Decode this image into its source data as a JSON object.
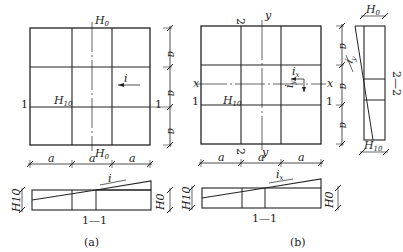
{
  "figure_a": {
    "caption": "(a)",
    "top_label": "H",
    "top_label_sub": "0",
    "bottom_label": "H",
    "bottom_label_sub": "0",
    "mid_label": "H",
    "mid_label_sub": "10",
    "slope_label": "i",
    "section_left": "1",
    "section_right": "1",
    "dim_label": "a",
    "section_title": "1—1",
    "section_left_label": "H10",
    "section_right_label": "H0",
    "section_slope": "i"
  },
  "figure_b": {
    "caption": "(b)",
    "axis_x": "x",
    "axis_y": "y",
    "section2_top": "2",
    "section2_bottom": "2",
    "section_left": "1",
    "section_right": "1",
    "mid_label": "H",
    "mid_label_sub": "10",
    "slope_x": "i",
    "slope_x_sub": "x",
    "slope_y": "i",
    "slope_y_sub": "y",
    "dim_label": "a",
    "section_title": "1—1",
    "section_left_label": "H10",
    "section_right_label": "H0",
    "section_slope": "i",
    "section_slope_sub": "x",
    "section2_title": "2—2",
    "section2_top_label": "H",
    "section2_top_sub": "0",
    "section2_bottom_label": "H",
    "section2_bottom_sub": "10"
  }
}
